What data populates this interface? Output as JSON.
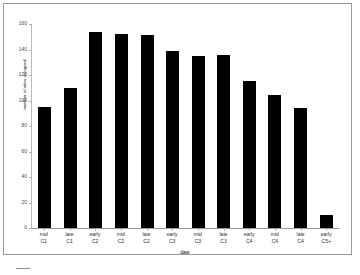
{
  "chart_data": {
    "type": "bar",
    "title": "",
    "xlabel": "date",
    "ylabel": "number of sites occupied",
    "ylim": [
      0,
      160
    ],
    "yticks": [
      0,
      20,
      40,
      60,
      80,
      100,
      120,
      140,
      160
    ],
    "grid": false,
    "legend": "none",
    "bar_color": "#000000",
    "categories": [
      "mid C1",
      "late C1",
      "early C2",
      "mid C2",
      "late C2",
      "early C3",
      "mid C3",
      "late C3",
      "early C4",
      "mid C4",
      "late C4",
      "early C5+"
    ],
    "category_lines": [
      {
        "line1": "mid",
        "line2": "C1"
      },
      {
        "line1": "late",
        "line2": "C1"
      },
      {
        "line1": "early",
        "line2": "C2"
      },
      {
        "line1": "mid",
        "line2": "C2"
      },
      {
        "line1": "late",
        "line2": "C2"
      },
      {
        "line1": "early",
        "line2": "C3"
      },
      {
        "line1": "mid",
        "line2": "C3"
      },
      {
        "line1": "late",
        "line2": "C3"
      },
      {
        "line1": "early",
        "line2": "C4"
      },
      {
        "line1": "mid",
        "line2": "C4"
      },
      {
        "line1": "late",
        "line2": "C4"
      },
      {
        "line1": "early",
        "line2": "C5+"
      }
    ],
    "values": [
      95,
      110,
      154,
      152,
      151,
      139,
      135,
      136,
      115,
      104,
      94,
      10
    ]
  }
}
